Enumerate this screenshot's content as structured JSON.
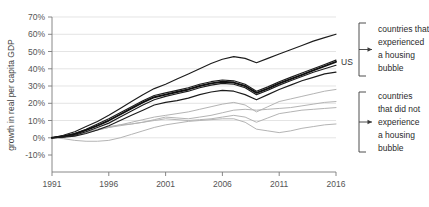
{
  "chart_data": {
    "type": "line",
    "title": "",
    "xlabel": "",
    "ylabel": "growth in real per capita GDP",
    "xlim": [
      1991,
      2016
    ],
    "ylim": [
      -10,
      70
    ],
    "ytick_labels": [
      "70%",
      "60%",
      "50%",
      "40%",
      "30%",
      "20%",
      "10%",
      "0%",
      "-10%"
    ],
    "ytick_values": [
      70,
      60,
      50,
      40,
      30,
      20,
      10,
      0,
      -10
    ],
    "xtick_labels": [
      "1991",
      "1996",
      "2001",
      "2006",
      "2011",
      "2016"
    ],
    "xtick_values": [
      1991,
      1996,
      2001,
      2006,
      2011,
      2016
    ],
    "grid": true,
    "legend_position": "right-brackets",
    "x": [
      1991,
      1992,
      1993,
      1994,
      1995,
      1996,
      1997,
      1998,
      1999,
      2000,
      2001,
      2002,
      2003,
      2004,
      2005,
      2006,
      2007,
      2008,
      2009,
      2010,
      2011,
      2012,
      2013,
      2014,
      2015,
      2016
    ],
    "series": [
      {
        "name": "bubble-country-1",
        "group": "experienced a housing bubble",
        "style": "dark",
        "values": [
          0,
          1.5,
          3.5,
          6.5,
          9.5,
          13,
          17,
          21,
          25,
          28.5,
          31,
          34,
          37,
          40,
          43,
          45.5,
          47,
          46,
          43.5,
          46,
          48.5,
          51,
          53.5,
          56,
          58,
          60
        ]
      },
      {
        "name": "bubble-country-2",
        "group": "experienced a housing bubble",
        "style": "dark",
        "values": [
          0,
          1,
          2.5,
          5,
          8,
          11,
          14.5,
          18,
          21.5,
          24.5,
          26,
          27.5,
          29,
          31,
          32.5,
          33.5,
          33,
          31,
          27,
          29.5,
          32.5,
          35,
          37.5,
          40,
          42.5,
          45
        ]
      },
      {
        "name": "bubble-country-3-us",
        "group": "experienced a housing bubble",
        "style": "dark-bold",
        "label": "US",
        "values": [
          0,
          0.8,
          2.2,
          4.5,
          7,
          10,
          13.5,
          17,
          20.5,
          23.5,
          25,
          26.5,
          28,
          30,
          31.5,
          32.5,
          32,
          30,
          26,
          28.5,
          31.5,
          34,
          36.5,
          39,
          41.5,
          44
        ]
      },
      {
        "name": "bubble-country-4",
        "group": "experienced a housing bubble",
        "style": "dark",
        "values": [
          0,
          0.5,
          1.5,
          3.5,
          6,
          8.5,
          12,
          15.5,
          19,
          22,
          24,
          25.5,
          27,
          29,
          30.5,
          31.5,
          31,
          29,
          25,
          27.5,
          30.5,
          33,
          35.5,
          38,
          40,
          42
        ]
      },
      {
        "name": "bubble-country-5",
        "group": "experienced a housing bubble",
        "style": "dark",
        "values": [
          0,
          0.3,
          1,
          2.5,
          4.5,
          7,
          10,
          13,
          16,
          19,
          20.5,
          21.5,
          23,
          25,
          26.5,
          27.5,
          27,
          25,
          22,
          25,
          28,
          30.5,
          33,
          35,
          37,
          38
        ]
      },
      {
        "name": "nonbubble-country-1",
        "group": "did not experience a housing bubble",
        "style": "light",
        "values": [
          0,
          0.5,
          1.5,
          3,
          4.5,
          6,
          7.5,
          9,
          10.5,
          12,
          13,
          14,
          15,
          16.5,
          18,
          19.5,
          20.5,
          19,
          15,
          18,
          21,
          22.5,
          24,
          25.5,
          27,
          28
        ]
      },
      {
        "name": "nonbubble-country-2",
        "group": "did not experience a housing bubble",
        "style": "light",
        "values": [
          0,
          1,
          2,
          3.5,
          5,
          6.5,
          7.5,
          8,
          9,
          10.5,
          12,
          11.5,
          11,
          12,
          13,
          14.5,
          16,
          16.5,
          16,
          16.5,
          17,
          17.5,
          18.5,
          19.5,
          20.5,
          21
        ]
      },
      {
        "name": "nonbubble-country-3",
        "group": "did not experience a housing bubble",
        "style": "light",
        "values": [
          0,
          0.5,
          1.5,
          3,
          4.5,
          6,
          7,
          8,
          9,
          10,
          11,
          10.5,
          10,
          10.5,
          11,
          12,
          13,
          12,
          9,
          11.5,
          14,
          15,
          16,
          16.5,
          17,
          17.5
        ]
      },
      {
        "name": "nonbubble-country-4",
        "group": "did not experience a housing bubble",
        "style": "light",
        "values": [
          0,
          -0.5,
          -1.5,
          -2,
          -2,
          -1.5,
          0,
          2,
          4,
          6,
          7.5,
          8.5,
          9.5,
          10,
          10.5,
          11,
          11,
          9,
          5,
          4,
          3,
          4,
          5.5,
          6.5,
          7.5,
          8
        ]
      }
    ],
    "annotations": [
      {
        "name": "bubble-group-annotation",
        "text_lines": [
          "countries that",
          "experienced",
          "a housing",
          "bubble"
        ]
      },
      {
        "name": "nonbubble-group-annotation",
        "text_lines": [
          "countries",
          "that did not",
          "experience",
          "a housing",
          "bubble"
        ]
      }
    ],
    "point_labels": [
      {
        "name": "us-line-label",
        "text": "US"
      }
    ]
  },
  "colors": {
    "background": "#ffffff",
    "dark_line": "#1c1c1c",
    "light_line": "#b4b4b4",
    "gridline": "#d9d9d9",
    "axis": "#7a7a7a",
    "text": "#333333"
  }
}
